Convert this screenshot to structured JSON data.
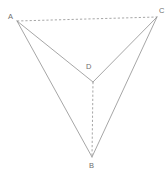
{
  "figure": {
    "type": "geometry-diagram",
    "shape_name": "tetrahedron",
    "background_color": "#ffffff",
    "stroke_color": "#8f8f8f",
    "label_color": "#6e6e6e",
    "canvas": {
      "width": 168,
      "height": 173
    },
    "vertices": [
      {
        "id": "A",
        "label": "A",
        "x": 17,
        "y": 21,
        "label_x": 8,
        "label_y": 13
      },
      {
        "id": "C",
        "label": "C",
        "x": 157,
        "y": 17,
        "label_x": 159,
        "label_y": 7
      },
      {
        "id": "B",
        "label": "B",
        "x": 92,
        "y": 157,
        "label_x": 89,
        "label_y": 162
      },
      {
        "id": "D",
        "label": "D",
        "x": 93,
        "y": 82,
        "label_x": 86,
        "label_y": 63
      }
    ],
    "edges": [
      {
        "id": "AD",
        "from": "A",
        "to": "D",
        "style": "solid"
      },
      {
        "id": "AB",
        "from": "A",
        "to": "B",
        "style": "solid"
      },
      {
        "id": "CD",
        "from": "C",
        "to": "D",
        "style": "solid"
      },
      {
        "id": "CB",
        "from": "C",
        "to": "B",
        "style": "solid"
      },
      {
        "id": "AC",
        "from": "A",
        "to": "C",
        "style": "dashed"
      },
      {
        "id": "DB",
        "from": "D",
        "to": "B",
        "style": "dashed"
      }
    ]
  }
}
